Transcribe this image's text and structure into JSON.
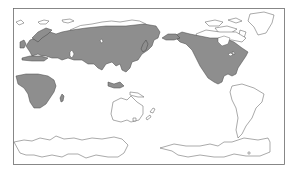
{
  "map": {
    "type": "world distribution map",
    "projection": "Pacific-centered equirectangular",
    "background_color": "#ffffff",
    "range_fill_color": "#8e8e8e",
    "outline_color": "#444444",
    "shaded_regions": [
      "Europe",
      "Northern Africa coast",
      "Sub-Saharan Africa",
      "Temperate and southern Asia",
      "Japan",
      "Southeast Asia",
      "Alaska",
      "Canada (southern)",
      "United States",
      "Mexico"
    ],
    "unshaded_regions": [
      "Sahara",
      "Arctic islands",
      "Greenland",
      "Australia",
      "New Zealand",
      "South America",
      "Antarctica"
    ]
  }
}
